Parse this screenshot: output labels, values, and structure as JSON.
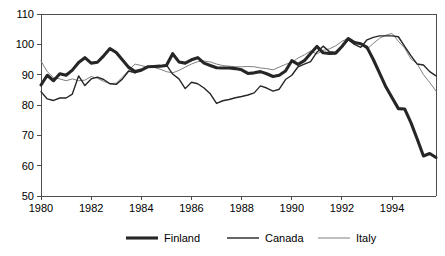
{
  "chart_data": {
    "type": "line",
    "title": "",
    "subtitle": "",
    "xlabel": "",
    "ylabel": "",
    "xlim": [
      1980.0,
      1995.75
    ],
    "ylim": [
      50,
      110
    ],
    "ytick_values": [
      50,
      60,
      70,
      80,
      90,
      100,
      110
    ],
    "ytick_labels": [
      "50",
      "60",
      "70",
      "80",
      "90",
      "100",
      "110"
    ],
    "xtick_values": [
      1980,
      1982,
      1984,
      1986,
      1988,
      1990,
      1992,
      1994
    ],
    "xtick_labels": [
      "1980",
      "1982",
      "1984",
      "1986",
      "1988",
      "1990",
      "1992",
      "1994"
    ],
    "grid": false,
    "legend_position": "bottom",
    "x_step": 0.25,
    "x_start": 1980.0,
    "series": [
      {
        "name": "Finland",
        "color": "#262626",
        "width": 3.1,
        "values": [
          86.6,
          89.8,
          88.0,
          90.3,
          89.8,
          91.5,
          94.0,
          95.6,
          93.8,
          94.1,
          96.2,
          98.6,
          97.3,
          94.8,
          92.4,
          91.0,
          91.5,
          92.6,
          92.7,
          92.8,
          93.0,
          96.9,
          94.2,
          93.8,
          94.9,
          95.6,
          93.8,
          93.0,
          92.3,
          92.2,
          92.2,
          92.0,
          91.6,
          90.4,
          90.6,
          91.0,
          90.3,
          89.4,
          89.8,
          91.2,
          94.6,
          93.4,
          94.6,
          97.0,
          99.3,
          97.2,
          97.0,
          97.1,
          99.3,
          101.9,
          100.6,
          100.2,
          99.0,
          95.0,
          90.5,
          86.0,
          82.4,
          78.8,
          78.7,
          74.2,
          68.8,
          63.2,
          64.0,
          62.7,
          61.9,
          63.2,
          63.8,
          64.0,
          64.1,
          64.4,
          66.6,
          69.6,
          71.0,
          71.8,
          72.0,
          72.0
        ]
      },
      {
        "name": "Canada",
        "color": "#262626",
        "width": 1.4,
        "values": [
          84.4,
          82.0,
          81.5,
          82.3,
          82.3,
          83.6,
          89.6,
          86.4,
          88.6,
          89.2,
          88.4,
          87.0,
          86.8,
          88.6,
          91.2,
          90.6,
          91.6,
          92.6,
          92.5,
          92.9,
          93.2,
          90.2,
          88.6,
          85.4,
          87.5,
          87.0,
          85.6,
          83.7,
          80.5,
          81.4,
          81.8,
          82.4,
          82.8,
          83.3,
          84.0,
          86.3,
          85.6,
          84.6,
          85.2,
          88.4,
          89.8,
          92.6,
          93.5,
          94.3,
          97.4,
          99.4,
          97.6,
          97.3,
          99.3,
          101.5,
          100.0,
          99.0,
          101.5,
          102.3,
          102.8,
          102.8,
          102.8,
          102.5,
          99.3,
          96.3,
          93.5,
          93.2,
          91.0,
          89.6,
          88.0,
          88.8,
          86.7,
          86.0,
          86.0,
          84.6,
          83.4,
          81.9,
          80.2,
          76.9,
          76.0,
          78.0
        ]
      },
      {
        "name": "Italy",
        "color": "#808080",
        "width": 1.0,
        "values": [
          94.5,
          91.0,
          89.0,
          88.6,
          88.0,
          88.6,
          88.0,
          88.2,
          89.4,
          88.8,
          87.8,
          87.0,
          87.2,
          89.2,
          91.5,
          93.5,
          93.0,
          92.5,
          92.4,
          91.8,
          91.0,
          90.6,
          91.4,
          92.5,
          93.5,
          94.3,
          94.5,
          94.2,
          93.5,
          93.0,
          92.8,
          92.6,
          92.6,
          92.7,
          92.6,
          92.2,
          92.0,
          91.6,
          92.5,
          93.4,
          94.0,
          95.5,
          96.5,
          97.8,
          96.8,
          98.0,
          98.5,
          99.5,
          101.0,
          102.0,
          101.0,
          100.0,
          98.4,
          100.3,
          102.0,
          103.0,
          103.6,
          101.0,
          98.8,
          95.2,
          93.6,
          90.0,
          87.4,
          84.6,
          83.0,
          82.6,
          81.2,
          80.3,
          79.6,
          78.0,
          77.0,
          76.8,
          76.4,
          72.2,
          68.8,
          68.0
        ]
      }
    ],
    "legend": [
      {
        "label": "Finland",
        "color": "#262626",
        "width": 3.1
      },
      {
        "label": "Canada",
        "color": "#262626",
        "width": 1.4
      },
      {
        "label": "Italy",
        "color": "#808080",
        "width": 1.0
      }
    ]
  },
  "plot": {
    "left": 41,
    "right": 436,
    "top": 14,
    "bottom": 196,
    "axis_color": "#4d4d4d",
    "background": "#ffffff"
  }
}
